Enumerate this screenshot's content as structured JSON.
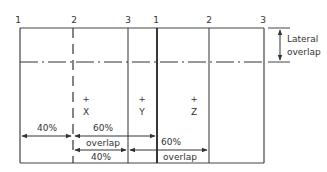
{
  "diagram": {
    "type": "aerial-photo-overlap",
    "strip1_labels": [
      "1",
      "2",
      "3"
    ],
    "strip2_labels": [
      "1",
      "2",
      "3"
    ],
    "points": [
      "X",
      "Y",
      "Z"
    ],
    "point_marker": "+",
    "lateral_overlap_label_line1": "Lateral",
    "lateral_overlap_label_line2": "overlap",
    "dim_40_left": "40%",
    "dim_60_top": "60%",
    "dim_overlap_top": "overlap",
    "dim_40_bottom": "40%",
    "dim_60_right": "60%",
    "dim_overlap_right": "overlap",
    "colors": {
      "line": "#333333",
      "background": "#ffffff"
    }
  }
}
